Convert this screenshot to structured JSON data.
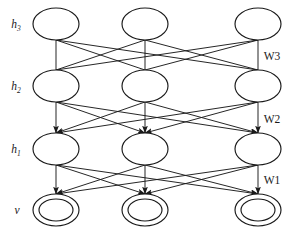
{
  "figure": {
    "background_color": "#ffffff",
    "stroke_color": "#1a1a1a",
    "width": 308,
    "height": 235
  },
  "layers": [
    {
      "id": "h3",
      "label_main": "h",
      "label_sub": "3",
      "node_style": "ellipse",
      "node_count": 3,
      "row_y": 24,
      "label_x": 16,
      "label_y": 28
    },
    {
      "id": "h2",
      "label_main": "h",
      "label_sub": "2",
      "node_style": "ellipse",
      "node_count": 3,
      "row_y": 86,
      "label_x": 16,
      "label_y": 90
    },
    {
      "id": "h1",
      "label_main": "h",
      "label_sub": "1",
      "node_style": "ellipse",
      "node_count": 3,
      "row_y": 149,
      "label_x": 16,
      "label_y": 153
    },
    {
      "id": "v",
      "label_main": "v",
      "label_sub": "",
      "node_style": "double-ellipse",
      "node_count": 3,
      "row_y": 210,
      "label_x": 17,
      "label_y": 214
    }
  ],
  "columns": [
    56,
    145,
    258
  ],
  "node_geometry": {
    "rx": 23,
    "ry": 16,
    "inner_rx": 17,
    "inner_ry": 11
  },
  "connections": [
    {
      "id": "w3",
      "from_layer": "h3",
      "to_layer": "h2",
      "directed": false,
      "label": "W3",
      "label_x": 272,
      "label_y": 60,
      "edge_count": 9
    },
    {
      "id": "w2",
      "from_layer": "h2",
      "to_layer": "h1",
      "directed": true,
      "label": "W2",
      "label_x": 272,
      "label_y": 123,
      "edge_count": 9
    },
    {
      "id": "w1",
      "from_layer": "h1",
      "to_layer": "v",
      "directed": true,
      "label": "W1",
      "label_x": 272,
      "label_y": 184,
      "edge_count": 9
    }
  ],
  "chart_data": {
    "type": "diagram",
    "diagram_kind": "deep-belief-network",
    "node_layers": [
      {
        "name": "h3",
        "display": "h₃",
        "units": 3,
        "shape": "ellipse"
      },
      {
        "name": "h2",
        "display": "h₂",
        "units": 3,
        "shape": "ellipse"
      },
      {
        "name": "h1",
        "display": "h₁",
        "units": 3,
        "shape": "ellipse"
      },
      {
        "name": "v",
        "display": "v",
        "units": 3,
        "shape": "double-ellipse"
      }
    ],
    "weight_labels": [
      "W3",
      "W2",
      "W1"
    ],
    "edges": [
      {
        "weight": "W3",
        "between": [
          "h3",
          "h2"
        ],
        "type": "undirected",
        "fully_connected": true
      },
      {
        "weight": "W2",
        "between": [
          "h2",
          "h1"
        ],
        "type": "directed-downward",
        "fully_connected": true
      },
      {
        "weight": "W1",
        "between": [
          "h1",
          "v"
        ],
        "type": "directed-downward",
        "fully_connected": true
      }
    ]
  }
}
